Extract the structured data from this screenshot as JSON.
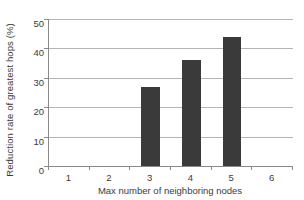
{
  "chart_data": {
    "type": "bar",
    "title": "",
    "xlabel": "Max number of neighboring nodes",
    "ylabel": "Reduction rate of greatest hops (%)",
    "categories": [
      "1",
      "2",
      "3",
      "4",
      "5",
      "6"
    ],
    "values": [
      0,
      0,
      27,
      36,
      44,
      0
    ],
    "ylim": [
      0,
      50
    ],
    "yticks": [
      0,
      10,
      20,
      30,
      40,
      50
    ],
    "ytick_labels": [
      "0",
      "10",
      "20",
      "30",
      "40",
      "50"
    ],
    "xtick_labels": [
      "1",
      "2",
      "3",
      "4",
      "5",
      "6"
    ],
    "grid": true,
    "grid_axis": "y",
    "legend": null,
    "legend_position": "none",
    "series": [
      {
        "name": "Reduction rate of greatest hops",
        "values": [
          0,
          0,
          27,
          36,
          44,
          0
        ]
      }
    ],
    "colors": {
      "bar": "#3a3a3a",
      "gridline": "#b4b4b4",
      "axis": "#8a8a8a",
      "text": "#3b3b3b",
      "background": "#ffffff"
    }
  }
}
